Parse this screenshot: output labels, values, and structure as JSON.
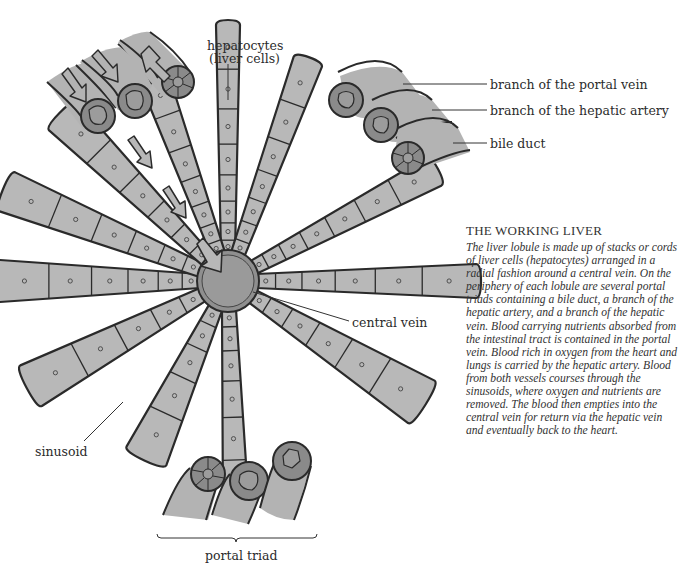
{
  "figure": {
    "title": "THE WORKING LIVER",
    "caption": "The liver lobule is made up of stacks or cords of liver cells (hepatocytes) arranged in a radial fashion around a central vein. On the periphery of each lobule are several portal triads containing a bile duct, a branch of the hepatic artery, and a branch of the hepatic vein. Blood carrying nutrients absorbed from the intestinal tract is contained in the portal vein. Blood rich in oxygen from the heart and lungs is carried by the hepatic artery. Blood from both vessels courses through the sinusoids, where oxygen and nutrients are removed. The blood then empties into the central vein for return via the hepatic vein and eventually back to the heart."
  },
  "labels": {
    "hepatocytes_line1": "hepatocytes",
    "hepatocytes_line2": "(liver cells)",
    "portal_vein": "branch of the portal vein",
    "hepatic_artery": "branch of the hepatic artery",
    "bile_duct": "bile duct",
    "central_vein": "central vein",
    "sinusoid": "sinusoid",
    "portal_triad": "portal triad"
  },
  "colors": {
    "cell_fill": "#b8b8b8",
    "vessel_fill": "#b3b3b3",
    "vessel_end": "#8a8a8a",
    "vein_core": "#9a9a9a",
    "outline": "#2a2a2a",
    "background": "#ffffff"
  }
}
